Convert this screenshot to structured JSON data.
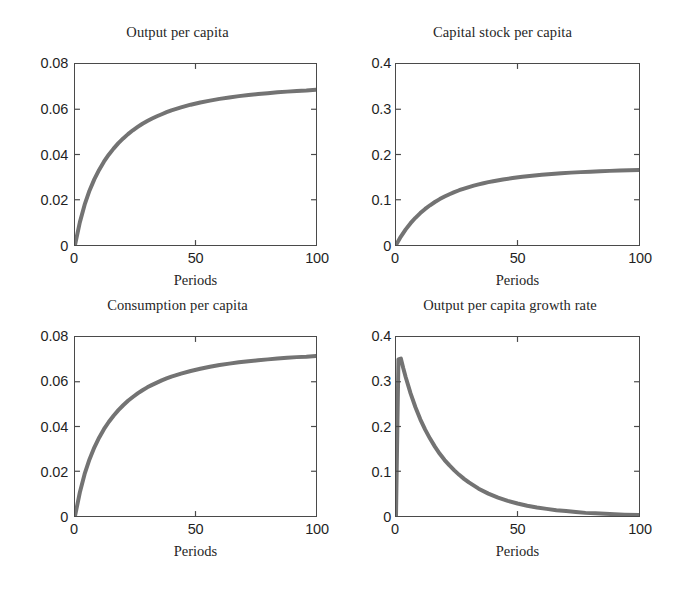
{
  "figure": {
    "background": "#ffffff",
    "axis_color": "#4a4a4a",
    "curve_color": "#737373",
    "text_color": "#1f1f1f",
    "panel_count": 4
  },
  "chart_data": [
    {
      "type": "line",
      "panel": "top-left",
      "title": "Output per capita",
      "xlabel": "Periods",
      "ylabel": "",
      "xlim": [
        0,
        100
      ],
      "ylim": [
        0,
        0.08
      ],
      "xticks": [
        "0",
        "50",
        "100"
      ],
      "xtick_values": [
        0,
        50,
        100
      ],
      "yticks": [
        "0",
        "0.02",
        "0.04",
        "0.06",
        "0.08"
      ],
      "ytick_values": [
        0,
        0.02,
        0.04,
        0.06,
        0.08
      ],
      "grid": false,
      "legend": "none",
      "series": [
        {
          "name": "Output per capita",
          "x": [
            0,
            2,
            4,
            6,
            8,
            10,
            12,
            14,
            16,
            18,
            20,
            22,
            24,
            26,
            28,
            30,
            32,
            34,
            36,
            38,
            40,
            44,
            48,
            52,
            56,
            60,
            64,
            68,
            72,
            76,
            80,
            84,
            88,
            92,
            96,
            100
          ],
          "values": [
            0.0,
            0.01,
            0.0178,
            0.024,
            0.029,
            0.0332,
            0.0368,
            0.0399,
            0.0426,
            0.045,
            0.0471,
            0.049,
            0.0507,
            0.0522,
            0.0536,
            0.0548,
            0.0559,
            0.0569,
            0.0578,
            0.0587,
            0.0595,
            0.0608,
            0.062,
            0.063,
            0.0638,
            0.0646,
            0.0652,
            0.0658,
            0.0663,
            0.0667,
            0.0671,
            0.0675,
            0.0678,
            0.0681,
            0.0683,
            0.0686
          ]
        }
      ]
    },
    {
      "type": "line",
      "panel": "top-right",
      "title": "Capital stock per capita",
      "xlabel": "Periods",
      "ylabel": "",
      "xlim": [
        0,
        100
      ],
      "ylim": [
        0,
        0.4
      ],
      "xticks": [
        "0",
        "50",
        "100"
      ],
      "xtick_values": [
        0,
        50,
        100
      ],
      "yticks": [
        "0",
        "0.1",
        "0.2",
        "0.3",
        "0.4"
      ],
      "ytick_values": [
        0,
        0.1,
        0.2,
        0.3,
        0.4
      ],
      "grid": false,
      "legend": "none",
      "series": [
        {
          "name": "Capital stock per capita",
          "x": [
            0,
            2,
            4,
            6,
            8,
            10,
            12,
            14,
            16,
            18,
            20,
            22,
            24,
            26,
            28,
            30,
            32,
            34,
            36,
            38,
            40,
            44,
            48,
            52,
            56,
            60,
            64,
            68,
            72,
            76,
            80,
            84,
            88,
            92,
            96,
            100
          ],
          "values": [
            0.0,
            0.0186,
            0.0345,
            0.0482,
            0.0601,
            0.0705,
            0.0797,
            0.0878,
            0.095,
            0.1014,
            0.1071,
            0.1122,
            0.1168,
            0.121,
            0.1247,
            0.1281,
            0.1312,
            0.134,
            0.1365,
            0.1389,
            0.141,
            0.1448,
            0.148,
            0.1508,
            0.1532,
            0.1552,
            0.157,
            0.1586,
            0.1599,
            0.1611,
            0.1621,
            0.163,
            0.1638,
            0.1645,
            0.1651,
            0.1656
          ]
        }
      ]
    },
    {
      "type": "line",
      "panel": "bottom-left",
      "title": "Consumption per capita",
      "xlabel": "Periods",
      "ylabel": "",
      "xlim": [
        0,
        100
      ],
      "ylim": [
        0,
        0.08
      ],
      "xticks": [
        "0",
        "50",
        "100"
      ],
      "xtick_values": [
        0,
        50,
        100
      ],
      "yticks": [
        "0",
        "0.02",
        "0.04",
        "0.06",
        "0.08"
      ],
      "ytick_values": [
        0,
        0.02,
        0.04,
        0.06,
        0.08
      ],
      "grid": false,
      "legend": "none",
      "series": [
        {
          "name": "Consumption per capita",
          "x": [
            0,
            2,
            4,
            6,
            8,
            10,
            12,
            14,
            16,
            18,
            20,
            22,
            24,
            26,
            28,
            30,
            32,
            34,
            36,
            38,
            40,
            44,
            48,
            52,
            56,
            60,
            64,
            68,
            72,
            76,
            80,
            84,
            88,
            92,
            96,
            100
          ],
          "values": [
            0.0,
            0.0105,
            0.0188,
            0.0253,
            0.0306,
            0.035,
            0.0388,
            0.042,
            0.0448,
            0.0473,
            0.0495,
            0.0515,
            0.0532,
            0.0548,
            0.0562,
            0.0575,
            0.0586,
            0.0596,
            0.0606,
            0.0615,
            0.0623,
            0.0636,
            0.0648,
            0.0658,
            0.0667,
            0.0675,
            0.0681,
            0.0687,
            0.0692,
            0.0696,
            0.07,
            0.0704,
            0.0707,
            0.071,
            0.0712,
            0.0715
          ]
        }
      ]
    },
    {
      "type": "line",
      "panel": "bottom-right",
      "title": "Output per capita growth rate",
      "xlabel": "Periods",
      "ylabel": "",
      "xlim": [
        0,
        100
      ],
      "ylim": [
        0,
        0.4
      ],
      "xticks": [
        "0",
        "50",
        "100"
      ],
      "xtick_values": [
        0,
        50,
        100
      ],
      "yticks": [
        "0",
        "0.1",
        "0.2",
        "0.3",
        "0.4"
      ],
      "ytick_values": [
        0,
        0.1,
        0.2,
        0.3,
        0.4
      ],
      "grid": false,
      "legend": "none",
      "series": [
        {
          "name": "Output per capita growth rate",
          "x": [
            0,
            1,
            2,
            3,
            4,
            6,
            8,
            10,
            12,
            14,
            16,
            18,
            20,
            22,
            24,
            26,
            28,
            30,
            34,
            38,
            42,
            46,
            50,
            54,
            58,
            62,
            66,
            70,
            74,
            78,
            82,
            86,
            90,
            94,
            100
          ],
          "values": [
            0.0,
            0.35,
            0.352,
            0.33,
            0.31,
            0.274,
            0.243,
            0.216,
            0.193,
            0.173,
            0.155,
            0.139,
            0.125,
            0.113,
            0.102,
            0.092,
            0.083,
            0.075,
            0.061,
            0.05,
            0.041,
            0.034,
            0.028,
            0.023,
            0.019,
            0.016,
            0.013,
            0.011,
            0.009,
            0.007,
            0.006,
            0.005,
            0.004,
            0.003,
            0.002
          ]
        }
      ]
    }
  ],
  "panels": [
    {
      "id": "output-per-capita",
      "title": "Output per capita",
      "xlabel": "Periods",
      "yticks": [
        "0.08",
        "0.06",
        "0.04",
        "0.02",
        "0"
      ],
      "xticks": [
        "0",
        "50",
        "100"
      ]
    },
    {
      "id": "capital-stock-per-capita",
      "title": "Capital stock per capita",
      "xlabel": "Periods",
      "yticks": [
        "0.4",
        "0.3",
        "0.2",
        "0.1",
        "0"
      ],
      "xticks": [
        "0",
        "50",
        "100"
      ]
    },
    {
      "id": "consumption-per-capita",
      "title": "Consumption per capita",
      "xlabel": "Periods",
      "yticks": [
        "0.08",
        "0.06",
        "0.04",
        "0.02",
        "0"
      ],
      "xticks": [
        "0",
        "50",
        "100"
      ]
    },
    {
      "id": "output-per-capita-growth-rate",
      "title": "Output per capita growth rate",
      "xlabel": "Periods",
      "yticks": [
        "0.4",
        "0.3",
        "0.2",
        "0.1",
        "0"
      ],
      "xticks": [
        "0",
        "50",
        "100"
      ]
    }
  ]
}
